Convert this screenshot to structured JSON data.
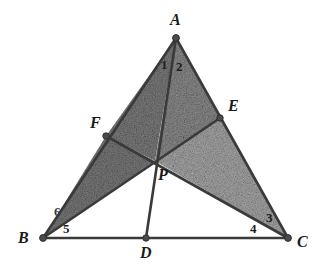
{
  "figure": {
    "width": 324,
    "height": 277,
    "background_color": "#ffffff",
    "stroke_color": "#3a3a3a",
    "dot_color": "#4a4a4a",
    "fill_dark": "#7e7e7e",
    "fill_mid": "#8e8e8e",
    "fill_light": "#a6a6a6",
    "points": {
      "A": {
        "label": "A",
        "x": 176,
        "y": 38,
        "label_x": 170,
        "label_y": 12
      },
      "B": {
        "label": "B",
        "x": 43,
        "y": 238,
        "label_x": 18,
        "label_y": 235
      },
      "C": {
        "label": "C",
        "x": 288,
        "y": 238,
        "label_x": 297,
        "label_y": 238
      },
      "D": {
        "label": "D",
        "x": 146,
        "y": 238,
        "label_x": 140,
        "label_y": 247
      },
      "E": {
        "label": "E",
        "x": 220,
        "y": 118,
        "label_x": 228,
        "label_y": 100
      },
      "F": {
        "label": "F",
        "x": 106,
        "y": 136,
        "label_x": 90,
        "label_y": 117
      },
      "P": {
        "label": "P",
        "x": 155,
        "y": 161,
        "label_x": 158,
        "label_y": 168
      }
    },
    "angle_labels": [
      {
        "name": "angle-1",
        "label": "1",
        "x": 161,
        "y": 60
      },
      {
        "name": "angle-2",
        "label": "2",
        "x": 177,
        "y": 62
      },
      {
        "name": "angle-3",
        "label": "3",
        "x": 266,
        "y": 213
      },
      {
        "name": "angle-4",
        "label": "4",
        "x": 251,
        "y": 224
      },
      {
        "name": "angle-5",
        "label": "5",
        "x": 63,
        "y": 224
      },
      {
        "name": "angle-6",
        "label": "6",
        "x": 55,
        "y": 207
      }
    ],
    "segments": [
      {
        "name": "side-AB",
        "from": "A",
        "to": "B"
      },
      {
        "name": "side-AC",
        "from": "A",
        "to": "C"
      },
      {
        "name": "side-BC",
        "from": "B",
        "to": "C"
      },
      {
        "name": "cevian-AD",
        "from": "A",
        "to": "D"
      },
      {
        "name": "cevian-BE",
        "from": "B",
        "to": "E"
      },
      {
        "name": "cevian-CF",
        "from": "C",
        "to": "F"
      }
    ],
    "shaded_regions": [
      {
        "name": "region-AFP",
        "vertices": [
          "A",
          "F",
          "P"
        ],
        "shade": "dark"
      },
      {
        "name": "region-APE",
        "vertices": [
          "A",
          "P",
          "E"
        ],
        "shade": "mid"
      },
      {
        "name": "region-BFP",
        "vertices": [
          "B",
          "F",
          "P"
        ],
        "shade": "dark"
      },
      {
        "name": "region-PEC",
        "vertices": [
          "P",
          "E",
          "C"
        ],
        "shade": "light"
      }
    ],
    "unshaded_regions": [
      {
        "name": "region-BPD",
        "vertices": [
          "B",
          "P",
          "D"
        ]
      },
      {
        "name": "region-DPC",
        "vertices": [
          "D",
          "P",
          "C"
        ]
      }
    ]
  }
}
